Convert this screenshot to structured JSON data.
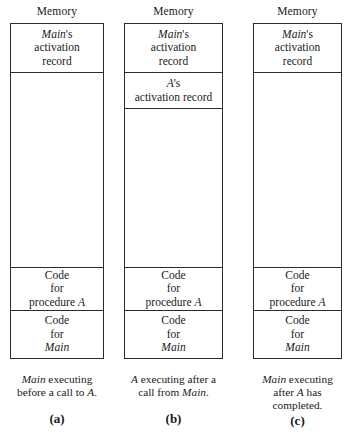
{
  "figure": {
    "memory_label": "Memory",
    "panels": [
      {
        "id": "a",
        "label": "(a)",
        "memory_label": "Memory",
        "segments": {
          "main_activation": [
            "Main",
            "'s",
            "activation",
            "record"
          ],
          "code_procedure_a": [
            "Code",
            "for",
            "procedure ",
            "A"
          ],
          "code_main": [
            "Code",
            "for",
            "Main"
          ]
        },
        "caption": [
          "Main",
          " executing",
          "before a call to ",
          "A",
          "."
        ],
        "caption_lines": [
          "Main executing",
          "before a call to A."
        ]
      },
      {
        "id": "b",
        "label": "(b)",
        "memory_label": "Memory",
        "segments": {
          "main_activation": [
            "Main",
            "'s",
            "activation",
            "record"
          ],
          "a_activation": [
            "A",
            "'s",
            "activation record"
          ],
          "code_procedure_a": [
            "Code",
            "for",
            "procedure ",
            "A"
          ],
          "code_main": [
            "Code",
            "for",
            "Main"
          ]
        },
        "caption_lines": [
          "A executing after a",
          "call from Main."
        ]
      },
      {
        "id": "c",
        "label": "(c)",
        "memory_label": "Memory",
        "segments": {
          "main_activation": [
            "Main",
            "'s",
            "activation",
            "record"
          ],
          "code_procedure_a": [
            "Code",
            "for",
            "procedure ",
            "A"
          ],
          "code_main": [
            "Code",
            "for",
            "Main"
          ]
        },
        "caption_lines": [
          "Main executing",
          "after A has",
          "completed."
        ]
      }
    ],
    "text": {
      "main_italic": "Main",
      "apostrophe_s": "'s",
      "activation": "activation",
      "record": "record",
      "activation_record": "activation record",
      "a_italic": "A",
      "code": "Code",
      "for": "for",
      "procedure": "procedure",
      "caption_a_line1_pre": "Main",
      "caption_a_line1_post": " executing",
      "caption_a_line2_pre": "before a call to ",
      "caption_a_line2_post": ".",
      "caption_b_line1_pre": "A",
      "caption_b_line1_post": " executing after a",
      "caption_b_line2_pre": "call from ",
      "caption_b_line2_post": ".",
      "caption_c_line1_pre": "Main",
      "caption_c_line1_post": " executing",
      "caption_c_line2_pre": "after ",
      "caption_c_line2_post": " has",
      "caption_c_line3": "completed."
    },
    "colors": {
      "background": "#ffffff",
      "ink": "#1a1a1a",
      "border": "#2b2b2b"
    }
  }
}
